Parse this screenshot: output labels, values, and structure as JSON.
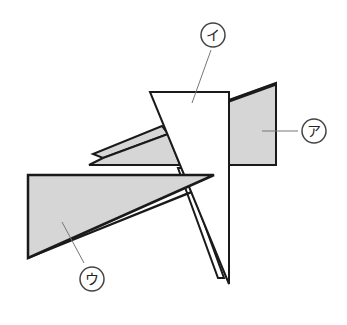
{
  "diagram": {
    "colors": {
      "background": "#ffffff",
      "stroke": "#1a1a1a",
      "gray_fill": "#d6d6d6",
      "white_fill": "#ffffff",
      "leader": "#777777",
      "label_circle": "#444444"
    },
    "labels": [
      {
        "id": "a",
        "text": "ア",
        "target": "right gray trapezoid"
      },
      {
        "id": "i",
        "text": "イ",
        "target": "white tall triangle"
      },
      {
        "id": "u",
        "text": "ウ",
        "target": "left gray triangle"
      }
    ]
  }
}
